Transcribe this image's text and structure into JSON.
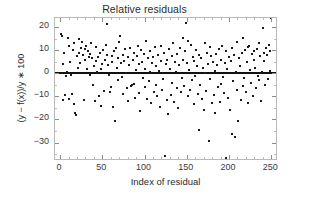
{
  "chart_data": {
    "type": "scatter",
    "title": "Relative residuals",
    "xlabel": "Index of residual",
    "ylabel": "(y − f(x))/y ∗ 100",
    "xlim": [
      -6,
      258
    ],
    "ylim": [
      -38,
      24
    ],
    "grid": false,
    "legend": null,
    "xticks": [
      0,
      50,
      100,
      150,
      200,
      250
    ],
    "xticklabels": [
      "0",
      "50",
      "100",
      "150",
      "200",
      "250"
    ],
    "yticks": [
      20,
      10,
      0,
      -10,
      -20,
      -30
    ],
    "yticklabels": [
      "20",
      "10",
      "0",
      "−10",
      "−20",
      "−30"
    ],
    "marker": "point",
    "marker_color": "#1b1b1b",
    "marker_size": 2,
    "reference_line": {
      "y": 0,
      "color": "#111111",
      "width": 2,
      "label": "zero residual line"
    },
    "n_points": 250,
    "x": [
      1,
      2,
      3,
      4,
      5,
      6,
      7,
      8,
      9,
      10,
      11,
      12,
      13,
      14,
      15,
      16,
      17,
      18,
      19,
      20,
      21,
      22,
      23,
      24,
      25,
      26,
      27,
      28,
      29,
      30,
      31,
      32,
      33,
      34,
      35,
      36,
      37,
      38,
      39,
      40,
      41,
      42,
      43,
      44,
      45,
      46,
      47,
      48,
      49,
      50,
      51,
      52,
      53,
      54,
      55,
      56,
      57,
      58,
      59,
      60,
      61,
      62,
      63,
      64,
      65,
      66,
      67,
      68,
      69,
      70,
      71,
      72,
      73,
      74,
      75,
      76,
      77,
      78,
      79,
      80,
      81,
      82,
      83,
      84,
      85,
      86,
      87,
      88,
      89,
      90,
      91,
      92,
      93,
      94,
      95,
      96,
      97,
      98,
      99,
      100,
      101,
      102,
      103,
      104,
      105,
      106,
      107,
      108,
      109,
      110,
      111,
      112,
      113,
      114,
      115,
      116,
      117,
      118,
      119,
      120,
      121,
      122,
      123,
      124,
      125,
      126,
      127,
      128,
      129,
      130,
      131,
      132,
      133,
      134,
      135,
      136,
      137,
      138,
      139,
      140,
      141,
      142,
      143,
      144,
      145,
      146,
      147,
      148,
      149,
      150,
      151,
      152,
      153,
      154,
      155,
      156,
      157,
      158,
      159,
      160,
      161,
      162,
      163,
      164,
      165,
      166,
      167,
      168,
      169,
      170,
      171,
      172,
      173,
      174,
      175,
      176,
      177,
      178,
      179,
      180,
      181,
      182,
      183,
      184,
      185,
      186,
      187,
      188,
      189,
      190,
      191,
      192,
      193,
      194,
      195,
      196,
      197,
      198,
      199,
      200,
      201,
      202,
      203,
      204,
      205,
      206,
      207,
      208,
      209,
      210,
      211,
      212,
      213,
      214,
      215,
      216,
      217,
      218,
      219,
      220,
      221,
      222,
      223,
      224,
      225,
      226,
      227,
      228,
      229,
      230,
      231,
      232,
      233,
      234,
      235,
      236,
      237,
      238,
      239,
      240,
      241,
      242,
      243,
      244,
      245,
      246,
      247,
      248,
      249,
      250
    ],
    "y": [
      17.0,
      16.3,
      4.0,
      -11.5,
      8.8,
      -9.5,
      -1.0,
      0.5,
      15.5,
      12.0,
      -11.0,
      5.0,
      -0.5,
      -9.0,
      10.0,
      -13.5,
      13.0,
      -17.0,
      -18.0,
      7.5,
      2.5,
      9.0,
      15.0,
      4.5,
      11.0,
      13.5,
      8.0,
      -11.5,
      6.0,
      10.5,
      12.0,
      2.0,
      9.5,
      7.0,
      -0.5,
      8.5,
      13.0,
      6.5,
      -5.0,
      3.0,
      -12.0,
      11.5,
      5.5,
      0.5,
      7.0,
      -10.0,
      9.0,
      2.0,
      -14.0,
      4.0,
      10.0,
      -7.5,
      6.0,
      12.5,
      8.0,
      21.5,
      3.5,
      -0.5,
      -8.0,
      -6.0,
      5.0,
      7.5,
      -14.5,
      9.5,
      -20.5,
      11.0,
      2.5,
      -3.0,
      6.5,
      13.5,
      16.0,
      4.5,
      -1.5,
      8.0,
      -9.0,
      5.5,
      10.5,
      0.0,
      -6.5,
      -12.0,
      7.0,
      3.5,
      11.0,
      -5.5,
      -5.0,
      6.0,
      9.0,
      -4.5,
      -10.5,
      1.5,
      7.5,
      12.0,
      -8.5,
      4.0,
      -16.5,
      10.0,
      5.0,
      -2.0,
      8.5,
      -6.0,
      2.0,
      14.0,
      -11.0,
      6.5,
      -3.5,
      9.5,
      0.5,
      -13.0,
      4.5,
      7.0,
      -8.0,
      11.5,
      -5.0,
      3.0,
      -10.0,
      8.0,
      1.0,
      -14.5,
      5.5,
      12.0,
      -7.0,
      -2.5,
      9.0,
      -36.0,
      4.0,
      -11.5,
      6.0,
      -17.5,
      10.5,
      2.0,
      -9.5,
      7.5,
      -4.0,
      13.0,
      -12.5,
      5.0,
      0.5,
      -6.5,
      8.5,
      -15.0,
      3.5,
      11.0,
      -8.0,
      -2.0,
      15.5,
      6.0,
      -5.5,
      9.5,
      22.0,
      4.5,
      -10.0,
      14.0,
      1.5,
      -7.0,
      12.5,
      -3.0,
      7.0,
      -13.5,
      5.5,
      -1.0,
      10.0,
      3.0,
      -9.0,
      -24.5,
      8.0,
      -5.0,
      6.5,
      -11.0,
      2.5,
      -16.0,
      13.0,
      0.0,
      -7.5,
      9.0,
      4.0,
      -29.5,
      11.5,
      -2.5,
      7.5,
      -13.0,
      5.0,
      -9.5,
      1.0,
      -17.0,
      8.5,
      3.5,
      -6.0,
      10.5,
      -12.5,
      6.0,
      -4.5,
      12.0,
      -1.5,
      -8.5,
      4.5,
      -36.5,
      9.5,
      2.0,
      -10.5,
      7.0,
      -16.0,
      5.5,
      -26.5,
      11.0,
      -3.5,
      8.0,
      -27.5,
      0.5,
      -7.0,
      13.5,
      -20.5,
      6.5,
      3.0,
      -11.5,
      9.0,
      -5.5,
      15.5,
      -2.0,
      10.0,
      -8.0,
      5.0,
      -13.0,
      11.5,
      12.0,
      1.5,
      -4.0,
      8.5,
      -10.0,
      6.0,
      9.5,
      2.5,
      -6.5,
      10.5,
      -1.0,
      13.0,
      -3.0,
      7.5,
      -12.0,
      0.5,
      19.5,
      5.5,
      9.0,
      -5.0,
      11.0,
      8.0,
      -2.5,
      12.5,
      1.0,
      9.5
    ]
  }
}
